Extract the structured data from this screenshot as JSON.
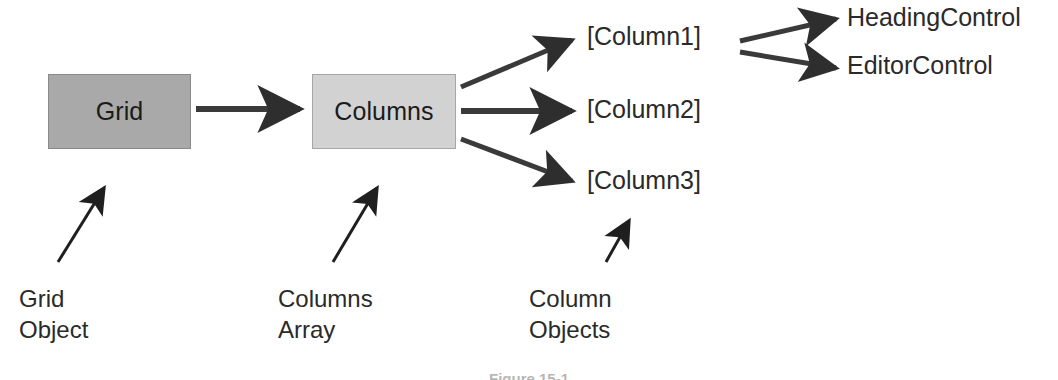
{
  "figure": {
    "caption": "Figure 15-1",
    "background_color": "#ffffff",
    "ink_color": "#2a2a2a"
  },
  "nodes": [
    {
      "id": "grid",
      "label": "Grid",
      "shape": "rectangle",
      "fill_color": "#a9a9a9",
      "border_color": "#8a8a8a"
    },
    {
      "id": "columns",
      "label": "Columns",
      "shape": "rectangle",
      "fill_color": "#d2d2d2",
      "border_color": "#a6a6a6"
    }
  ],
  "leaves": [
    {
      "id": "column1",
      "label": "[Column1]"
    },
    {
      "id": "column2",
      "label": "[Column2]"
    },
    {
      "id": "column3",
      "label": "[Column3]"
    },
    {
      "id": "heading_control",
      "label": "HeadingControl"
    },
    {
      "id": "editor_control",
      "label": "EditorControl"
    }
  ],
  "annotations": [
    {
      "id": "grid_object",
      "label": "Grid\nObject",
      "points_to": "grid"
    },
    {
      "id": "columns_array",
      "label": "Columns\nArray",
      "points_to": "columns"
    },
    {
      "id": "column_objects",
      "label": "Column\nObjects",
      "points_to": "column3"
    }
  ],
  "edges": [
    {
      "id": "grid-to-columns",
      "from": "grid",
      "to": "columns",
      "style": "solid-arrow"
    },
    {
      "id": "columns-to-column1",
      "from": "columns",
      "to": "column1",
      "style": "solid-arrow"
    },
    {
      "id": "columns-to-column2",
      "from": "columns",
      "to": "column2",
      "style": "solid-arrow"
    },
    {
      "id": "columns-to-column3",
      "from": "columns",
      "to": "column3",
      "style": "solid-arrow"
    },
    {
      "id": "column1-to-headingcontrol",
      "from": "column1",
      "to": "heading_control",
      "style": "solid-arrow"
    },
    {
      "id": "column1-to-editorcontrol",
      "from": "column1",
      "to": "editor_control",
      "style": "solid-arrow"
    },
    {
      "id": "grid-object-pointer",
      "from": "grid_object",
      "to": "grid",
      "style": "thin-arrow"
    },
    {
      "id": "columns-array-pointer",
      "from": "columns_array",
      "to": "columns",
      "style": "thin-arrow"
    },
    {
      "id": "column-objects-pointer",
      "from": "column_objects",
      "to": "column3",
      "style": "thin-arrow"
    }
  ]
}
